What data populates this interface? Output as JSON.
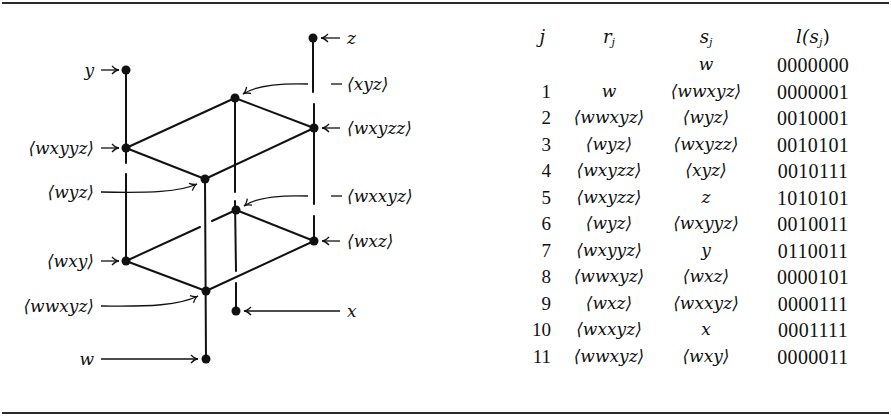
{
  "diagram": {
    "nodes": [
      {
        "id": "y",
        "label": "y",
        "x": 126,
        "y": 70
      },
      {
        "id": "z",
        "label": "z",
        "x": 313,
        "y": 38
      },
      {
        "id": "xyz",
        "label": "⟨xyz⟩",
        "x": 235,
        "y": 98
      },
      {
        "id": "wxyzz",
        "label": "⟨wxyzz⟩",
        "x": 314,
        "y": 128
      },
      {
        "id": "wxyyz",
        "label": "⟨wxyyz⟩",
        "x": 126,
        "y": 148
      },
      {
        "id": "wyz",
        "label": "⟨wyz⟩",
        "x": 205,
        "y": 179
      },
      {
        "id": "wxxyz",
        "label": "⟨wxxyz⟩",
        "x": 236,
        "y": 210
      },
      {
        "id": "wxz",
        "label": "⟨wxz⟩",
        "x": 314,
        "y": 241
      },
      {
        "id": "wxy",
        "label": "⟨wxy⟩",
        "x": 126,
        "y": 261
      },
      {
        "id": "wwxyz",
        "label": "⟨wwxyz⟩",
        "x": 206,
        "y": 291
      },
      {
        "id": "x",
        "label": "x",
        "x": 236,
        "y": 311
      },
      {
        "id": "w",
        "label": "w",
        "x": 206,
        "y": 359
      }
    ],
    "labels": {
      "y": "y",
      "z": "z",
      "xyz": "⟨xyz⟩",
      "wxyzz": "⟨wxyzz⟩",
      "wxyyz": "⟨wxyyz⟩",
      "wyz": "⟨wyz⟩",
      "wxxyz": "⟨wxxyz⟩",
      "wxz": "⟨wxz⟩",
      "wxy": "⟨wxy⟩",
      "wwxyz": "⟨wwxyz⟩",
      "x": "x",
      "w": "w"
    }
  },
  "table": {
    "headers": {
      "j": "j",
      "r": "r",
      "r_sub": "j",
      "s": "s",
      "s_sub": "j",
      "l": "l(s",
      "l_sub": "j",
      "l_close": ")"
    },
    "rows": [
      {
        "j": "",
        "r": "",
        "s": "w",
        "l": "0000000"
      },
      {
        "j": "1",
        "r": "w",
        "s": "⟨wwxyz⟩",
        "l": "0000001"
      },
      {
        "j": "2",
        "r": "⟨wwxyz⟩",
        "s": "⟨wyz⟩",
        "l": "0010001"
      },
      {
        "j": "3",
        "r": "⟨wyz⟩",
        "s": "⟨wxyzz⟩",
        "l": "0010101"
      },
      {
        "j": "4",
        "r": "⟨wxyzz⟩",
        "s": "⟨xyz⟩",
        "l": "0010111"
      },
      {
        "j": "5",
        "r": "⟨wxyzz⟩",
        "s": "z",
        "l": "1010101"
      },
      {
        "j": "6",
        "r": "⟨wyz⟩",
        "s": "⟨wxyyz⟩",
        "l": "0010011"
      },
      {
        "j": "7",
        "r": "⟨wxyyz⟩",
        "s": "y",
        "l": "0110011"
      },
      {
        "j": "8",
        "r": "⟨wwxyz⟩",
        "s": "⟨wxz⟩",
        "l": "0000101"
      },
      {
        "j": "9",
        "r": "⟨wxz⟩",
        "s": "⟨wxxyz⟩",
        "l": "0000111"
      },
      {
        "j": "10",
        "r": "⟨wxxyz⟩",
        "s": "x",
        "l": "0001111"
      },
      {
        "j": "11",
        "r": "⟨wwxyz⟩",
        "s": "⟨wxy⟩",
        "l": "0000011"
      }
    ]
  }
}
